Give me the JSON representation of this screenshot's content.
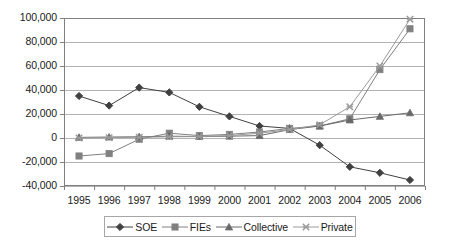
{
  "chart_data": {
    "type": "line",
    "title": "",
    "subtitle": "",
    "xlabel": "",
    "ylabel": "",
    "categories": [
      "1995",
      "1996",
      "1997",
      "1998",
      "1999",
      "2000",
      "2001",
      "2002",
      "2003",
      "2004",
      "2005",
      "2006"
    ],
    "x": [
      1995,
      1996,
      1997,
      1998,
      1999,
      2000,
      2001,
      2002,
      2003,
      2004,
      2005,
      2006
    ],
    "ylim": [
      -40000,
      100000
    ],
    "ytick_labels": [
      "100,000",
      "80,000",
      "60,000",
      "40,000",
      "20,000",
      "0",
      "-20,000",
      "-40,000"
    ],
    "ytick_values": [
      100000,
      80000,
      60000,
      40000,
      20000,
      0,
      -20000,
      -40000
    ],
    "grid": true,
    "grid_axis": "y",
    "legend_position": "bottom",
    "series": [
      {
        "name": "SOE",
        "marker": "diamond",
        "color": "#404040",
        "values": [
          35000,
          27000,
          42000,
          38000,
          26000,
          18000,
          10000,
          8000,
          -6000,
          -24000,
          -29000,
          -35000
        ]
      },
      {
        "name": "FIEs",
        "marker": "square",
        "color": "#808080",
        "values": [
          -15000,
          -13000,
          -1000,
          4000,
          2000,
          3000,
          5000,
          8000,
          10000,
          16000,
          57000,
          91000
        ]
      },
      {
        "name": "Collective",
        "marker": "triangle",
        "color": "#696969",
        "values": [
          500,
          800,
          1000,
          1500,
          1200,
          1500,
          2000,
          7000,
          10000,
          15000,
          18000,
          21000
        ]
      },
      {
        "name": "Private",
        "marker": "cross",
        "color": "#9a9a9a",
        "values": [
          0,
          300,
          600,
          1000,
          1200,
          2000,
          4000,
          7000,
          11000,
          26000,
          60000,
          99000
        ]
      }
    ]
  },
  "axes": {
    "frame_color": "#7f7f7f",
    "gridline_color": "#b3b3b3",
    "tick_color": "#7f7f7f"
  },
  "legend": {
    "entries": [
      {
        "label": "SOE",
        "marker": "diamond"
      },
      {
        "label": "FIEs",
        "marker": "square"
      },
      {
        "label": "Collective",
        "marker": "triangle"
      },
      {
        "label": "Private",
        "marker": "cross"
      }
    ]
  }
}
